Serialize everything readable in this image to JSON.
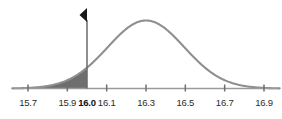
{
  "chart_data": {
    "type": "line",
    "title": "",
    "subtitle": "",
    "xlabel": "",
    "ylabel": "",
    "xlim": [
      15.62,
      16.98
    ],
    "ylim": [
      0,
      1.08
    ],
    "grid": false,
    "legend": null,
    "distribution": {
      "kind": "normal",
      "mean": 16.3,
      "std": 0.195,
      "peak_x": 16.3,
      "peak_y": 1.0
    },
    "x_ticks": [
      {
        "value": 15.7,
        "label": "15.7",
        "bold": false
      },
      {
        "value": 15.9,
        "label": "15.9",
        "bold": false
      },
      {
        "value": 16.0,
        "label": "16.0",
        "bold": true
      },
      {
        "value": 16.1,
        "label": "16.1",
        "bold": false
      },
      {
        "value": 16.3,
        "label": "16.3",
        "bold": false
      },
      {
        "value": 16.5,
        "label": "16.5",
        "bold": false
      },
      {
        "value": 16.7,
        "label": "16.7",
        "bold": false
      },
      {
        "value": 16.9,
        "label": "16.9",
        "bold": false
      }
    ],
    "y_ticks": [],
    "annotations": {
      "marker_line_x": 16.0,
      "marker_arrow": "left-pointing-triangle",
      "marker_arrow_position": "top-of-marker-line",
      "shaded_region": {
        "from": 15.62,
        "to": 16.0,
        "side": "left-tail",
        "label": ""
      }
    },
    "colors": {
      "curve": "#8f8f8f",
      "shaded_fill": "#6e6e6e",
      "axis": "#9a9a9a",
      "marker_line": "#6a6a6a",
      "marker_arrow": "#1a1a1a",
      "tick_mark": "#6f6f6f",
      "tick_label": "#2b2b2b",
      "background": "#ffffff"
    }
  }
}
